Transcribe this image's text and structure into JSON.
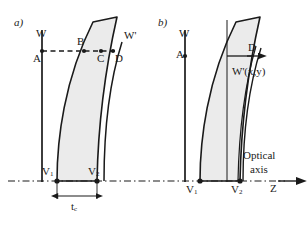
{
  "figure": {
    "type": "optics-lens-wavefront-diagram",
    "background_color": "#ffffff",
    "ink_color": "#1a1a1a",
    "lens_fill_color": "#ebebeb"
  },
  "panel_a": {
    "tag": "a)",
    "labels": {
      "wavefront_in": "W",
      "wavefront_out": "W'",
      "point_a": "A",
      "point_b": "B",
      "point_c": "C",
      "point_d": "D",
      "vertex_1": "V",
      "vertex_1_sub": "1",
      "vertex_2": "V",
      "vertex_2_sub": "2",
      "thickness": "t",
      "thickness_sub": "c"
    }
  },
  "panel_b": {
    "tag": "b)",
    "labels": {
      "wavefront_in": "W",
      "point_a": "A",
      "point_d": "D",
      "wavefront_out": "W'(x,y)",
      "vertex_1": "V",
      "vertex_1_sub": "1",
      "vertex_2": "V",
      "vertex_2_sub": "2"
    }
  },
  "axis": {
    "name_line1": "Optical",
    "name_line2": "axis",
    "symbol": "Z"
  }
}
